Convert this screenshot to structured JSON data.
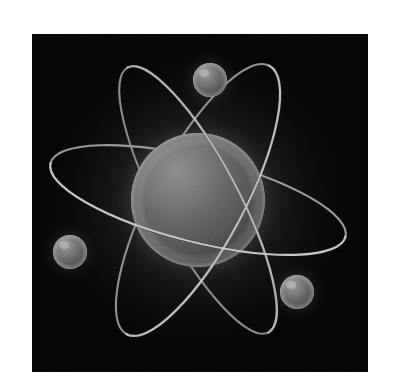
{
  "image": {
    "title": "Atom model illustration",
    "subject": "atom",
    "style": "3d-rendered grayscale",
    "width": 395,
    "height": 389,
    "background_color": "#ffffff",
    "panel": {
      "x": 32,
      "y": 34,
      "width": 336,
      "height": 338,
      "background_color": "#040404",
      "glow_color": "#3a3a3a"
    }
  },
  "scene": {
    "nucleus": {
      "label": "nucleus",
      "center_x": 198,
      "center_y": 200,
      "radius": 67,
      "base_color": "#5a5a5a",
      "highlight_color": "#8d8d8d",
      "shadow_color": "#2a2a2a"
    },
    "glow": {
      "label": "nucleus-glow",
      "center_x": 198,
      "center_y": 200,
      "radius": 160,
      "inner_color": "#4a4a4a",
      "outer_color": "#040404"
    },
    "orbits": [
      {
        "label": "orbit-ring-1",
        "rotation_deg": -62,
        "radius_x": 152,
        "radius_y": 46,
        "stroke_color": "#b4b4b4",
        "stroke_color_behind": "#1b1b1b",
        "stroke_width": 2.2
      },
      {
        "label": "orbit-ring-2",
        "rotation_deg": 14,
        "radius_x": 152,
        "radius_y": 42,
        "stroke_color": "#bdbdbd",
        "stroke_color_behind": "#1b1b1b",
        "stroke_width": 2.2
      },
      {
        "label": "orbit-ring-3",
        "rotation_deg": -118,
        "radius_x": 150,
        "radius_y": 40,
        "stroke_color": "#b0b0b0",
        "stroke_color_behind": "#1b1b1b",
        "stroke_width": 2.2
      }
    ],
    "electrons": [
      {
        "label": "electron-top",
        "center_x": 210,
        "center_y": 80,
        "radius": 17,
        "base_color": "#5e5e5e",
        "highlight_color": "#9a9a9a"
      },
      {
        "label": "electron-left",
        "center_x": 70,
        "center_y": 252,
        "radius": 17,
        "base_color": "#5c5c5c",
        "highlight_color": "#989898"
      },
      {
        "label": "electron-bottom-right",
        "center_x": 297,
        "center_y": 292,
        "radius": 17,
        "base_color": "#606060",
        "highlight_color": "#9c9c9c"
      }
    ]
  }
}
